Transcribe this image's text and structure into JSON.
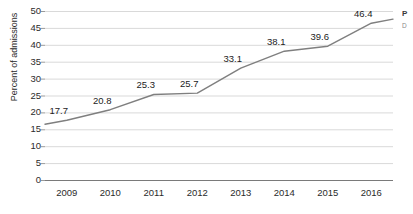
{
  "chart_data": {
    "type": "line",
    "title": "",
    "xlabel": "",
    "ylabel": "Percent of admissions",
    "categories": [
      "2009",
      "2010",
      "2011",
      "2012",
      "2013",
      "2014",
      "2015",
      "2016"
    ],
    "values": [
      17.7,
      20.8,
      25.3,
      25.7,
      33.1,
      38.1,
      39.6,
      46.4
    ],
    "data_labels": [
      "17.7",
      "20.8",
      "25.3",
      "25.7",
      "33.1",
      "38.1",
      "39.6",
      "46.4"
    ],
    "ylim": [
      0,
      50
    ],
    "yticks": [
      0,
      5,
      10,
      15,
      20,
      25,
      30,
      35,
      40,
      45,
      50
    ],
    "ytick_labels": [
      "0",
      "5",
      "10",
      "15",
      "20",
      "25",
      "30",
      "35",
      "40",
      "45",
      "50"
    ],
    "grid": true,
    "grid_axis": "y",
    "legend": "none",
    "series": [
      {
        "name": "Percent of admissions",
        "values": [
          17.7,
          20.8,
          25.3,
          25.7,
          33.1,
          38.1,
          39.6,
          46.4
        ],
        "color": "#808080"
      }
    ],
    "colors": {
      "line": "#7f7f7f",
      "grid": "#d9d9d9",
      "axis": "#808080",
      "text": "#2b2b2b"
    }
  },
  "legend_cropped": {
    "title": "P",
    "item": "D"
  }
}
